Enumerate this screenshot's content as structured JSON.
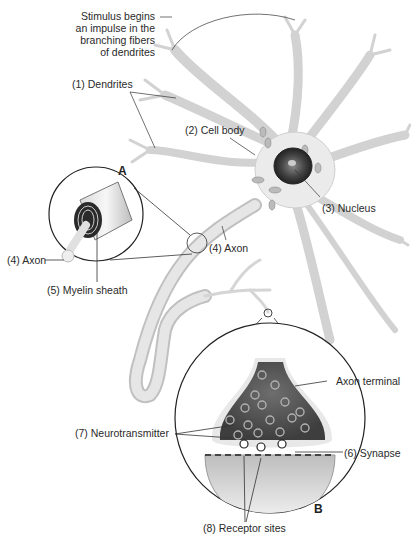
{
  "diagram": {
    "type": "anatomical-illustration",
    "panels": [
      {
        "id": "A",
        "label": "A",
        "description": "Magnified cross-section of axon with myelin sheath"
      },
      {
        "id": "B",
        "label": "B",
        "description": "Magnified axon terminal and synapse"
      }
    ],
    "labels": {
      "stimulus": [
        "Stimulus begins",
        "an impulse in the",
        "branching fibers",
        "of dendrites"
      ],
      "dendrites": "(1) Dendrites",
      "cell_body": "(2) Cell body",
      "nucleus": "(3) Nucleus",
      "axon_main": "(4) Axon",
      "axon_inset": "(4) Axon",
      "myelin": "(5) Myelin sheath",
      "synapse": "(6) Synapse",
      "neurotransmitter": "(7) Neurotransmitter",
      "receptor_sites": "(8) Receptor sites",
      "axon_terminal": "Axon terminal"
    },
    "colors": {
      "background": "#ffffff",
      "cell_fill": "#f1f1f1",
      "cell_stroke": "#c8c8c8",
      "nucleus": "#3a3a3a",
      "terminal_dark": "#5a5a5a",
      "line": "#333333"
    }
  }
}
